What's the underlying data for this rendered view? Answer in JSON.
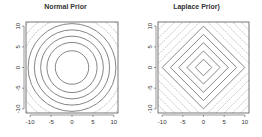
{
  "chart_data": [
    {
      "type": "contour",
      "title": "Normal Prior",
      "xlabel": "",
      "ylabel": "",
      "xlim": [
        -11,
        11
      ],
      "ylim": [
        -11,
        11
      ],
      "x_ticks": [
        -10,
        -5,
        0,
        5,
        10
      ],
      "y_ticks": [
        -10,
        -5,
        0,
        5,
        10
      ],
      "x_tick_labels": [
        "-10",
        "-5",
        "0",
        "5",
        "10"
      ],
      "y_tick_labels": [
        "-10",
        "-5",
        "0",
        "5",
        "10"
      ],
      "contour_shape": "circle",
      "contour_radii": [
        4,
        6,
        7.5,
        9,
        10.5,
        12,
        13.5,
        15
      ],
      "grid": false,
      "legend": null
    },
    {
      "type": "contour",
      "title": "Laplace Prior)",
      "xlabel": "",
      "ylabel": "",
      "xlim": [
        -11,
        11
      ],
      "ylim": [
        -11,
        11
      ],
      "x_ticks": [
        -10,
        -5,
        0,
        5,
        10
      ],
      "y_ticks": [
        -10,
        -5,
        0,
        5,
        10
      ],
      "x_tick_labels": [
        "-10",
        "-5",
        "0",
        "5",
        "10"
      ],
      "y_tick_labels": [
        "-10",
        "-5",
        "0",
        "5",
        "10"
      ],
      "contour_shape": "diamond",
      "contour_radii": [
        2,
        4,
        6,
        8,
        10,
        12,
        14,
        16,
        18,
        20
      ],
      "grid": false,
      "legend": null
    }
  ],
  "panels": [
    {
      "title": "Normal Prior"
    },
    {
      "title": "Laplace Prior)"
    }
  ]
}
